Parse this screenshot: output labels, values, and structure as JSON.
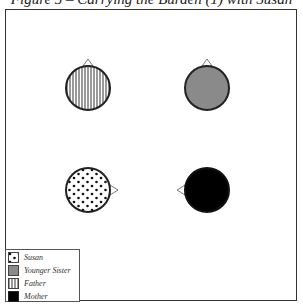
{
  "title": "Figure 5 – Carrying the Burden (1) with Susan",
  "diagram": {
    "nodes": [
      {
        "id": "father",
        "label": "Father",
        "cx": 88,
        "cy": 88,
        "r": 22,
        "fill": "pattern-vertical-lines",
        "pointer": "up"
      },
      {
        "id": "younger-sister",
        "label": "Younger Sister",
        "cx": 207,
        "cy": 88,
        "r": 22,
        "fill": "#8a8a8a",
        "pointer": "up"
      },
      {
        "id": "susan",
        "label": "Susan",
        "cx": 88,
        "cy": 190,
        "r": 22,
        "fill": "pattern-dots",
        "pointer": "right"
      },
      {
        "id": "mother",
        "label": "Mother",
        "cx": 207,
        "cy": 190,
        "r": 22,
        "fill": "#000000",
        "pointer": "left"
      }
    ]
  },
  "legend": {
    "items": [
      {
        "label": "Susan",
        "swatch": "dots"
      },
      {
        "label": "Younger Sister",
        "swatch": "gray"
      },
      {
        "label": "Father",
        "swatch": "vertical-lines"
      },
      {
        "label": "Mother",
        "swatch": "black"
      }
    ]
  },
  "colors": {
    "gray": "#8a8a8a",
    "black": "#000000",
    "stroke": "#222222"
  }
}
